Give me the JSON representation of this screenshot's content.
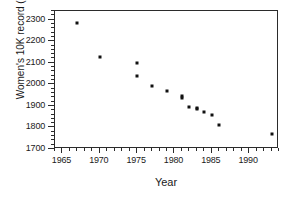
{
  "chart_data": {
    "type": "scatter",
    "title": "",
    "xlabel": "Year",
    "ylabel": "Women's 10K record (seconds)",
    "xlim": [
      1964,
      1994
    ],
    "ylim": [
      1700,
      2340
    ],
    "grid": false,
    "legend": null,
    "marker": {
      "shape": "square",
      "color": "#111111",
      "size_px": 3
    },
    "x_ticks_major": [
      1965,
      1970,
      1975,
      1980,
      1985,
      1990
    ],
    "x_tick_labels": [
      "1965",
      "1970",
      "1975",
      "1980",
      "1985",
      "1990"
    ],
    "x_minor_step": 1,
    "y_ticks_major": [
      1700,
      1800,
      1900,
      2000,
      2100,
      2200,
      2300
    ],
    "y_tick_labels": [
      "1700",
      "1800",
      "1900",
      "2000",
      "2100",
      "2200",
      "2300"
    ],
    "y_minor_step": 20,
    "points": [
      {
        "x": 1967,
        "y": 2285
      },
      {
        "x": 1970,
        "y": 2128
      },
      {
        "x": 1975,
        "y": 2098
      },
      {
        "x": 1975,
        "y": 2038
      },
      {
        "x": 1977,
        "y": 1993
      },
      {
        "x": 1979,
        "y": 1970
      },
      {
        "x": 1981,
        "y": 1944
      },
      {
        "x": 1981,
        "y": 1936
      },
      {
        "x": 1982,
        "y": 1895
      },
      {
        "x": 1983,
        "y": 1889
      },
      {
        "x": 1983,
        "y": 1884
      },
      {
        "x": 1984,
        "y": 1872
      },
      {
        "x": 1985,
        "y": 1857
      },
      {
        "x": 1986,
        "y": 1811
      },
      {
        "x": 1993,
        "y": 1768
      }
    ]
  }
}
